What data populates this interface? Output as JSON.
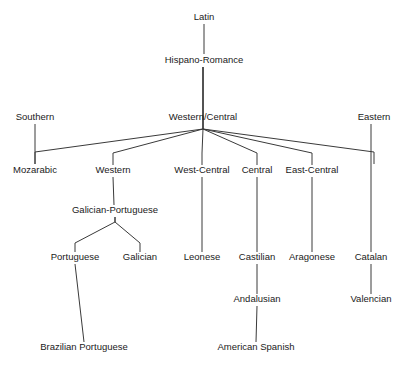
{
  "figure": {
    "kind": "language-family-tree",
    "background_color": "#ffffff",
    "line_color": "#3a3a3a",
    "text_color": "#1a1a1a"
  },
  "nodes": [
    {
      "id": "latin",
      "label": "Latin",
      "x": 204,
      "y": 20
    },
    {
      "id": "hispano-romance",
      "label": "Hispano-Romance",
      "x": 204,
      "y": 63
    },
    {
      "id": "southern",
      "label": "Southern",
      "x": 35,
      "y": 120
    },
    {
      "id": "western-central",
      "label": "Western/Central",
      "x": 203,
      "y": 120
    },
    {
      "id": "eastern",
      "label": "Eastern",
      "x": 374,
      "y": 120
    },
    {
      "id": "mozarabic",
      "label": "Mozarabic",
      "x": 35,
      "y": 173
    },
    {
      "id": "western",
      "label": "Western",
      "x": 113,
      "y": 173
    },
    {
      "id": "west-central",
      "label": "West-Central",
      "x": 202,
      "y": 173
    },
    {
      "id": "central",
      "label": "Central",
      "x": 257,
      "y": 173
    },
    {
      "id": "east-central",
      "label": "East-Central",
      "x": 312,
      "y": 173
    },
    {
      "id": "galician-portuguese",
      "label": "Galician-Portuguese",
      "x": 115,
      "y": 213
    },
    {
      "id": "portuguese",
      "label": "Portuguese",
      "x": 75,
      "y": 260
    },
    {
      "id": "galician",
      "label": "Galician",
      "x": 140,
      "y": 260
    },
    {
      "id": "leonese",
      "label": "Leonese",
      "x": 202,
      "y": 260
    },
    {
      "id": "castilian",
      "label": "Castilian",
      "x": 257,
      "y": 260
    },
    {
      "id": "aragonese",
      "label": "Aragonese",
      "x": 312,
      "y": 260
    },
    {
      "id": "catalan",
      "label": "Catalan",
      "x": 371,
      "y": 260
    },
    {
      "id": "andalusian",
      "label": "Andalusian",
      "x": 257,
      "y": 302
    },
    {
      "id": "valencian",
      "label": "Valencian",
      "x": 371,
      "y": 302
    },
    {
      "id": "brazilian-portuguese",
      "label": "Brazilian Portuguese",
      "x": 84,
      "y": 350
    },
    {
      "id": "american-spanish",
      "label": "American Spanish",
      "x": 256,
      "y": 350
    }
  ],
  "edges": [
    {
      "from": "latin",
      "to": "hispano-romance",
      "points": [
        [
          204,
          24
        ],
        [
          204,
          54
        ]
      ]
    },
    {
      "from": "hispano-romance",
      "to": "southern",
      "points": [
        [
          203,
          67
        ],
        [
          203,
          129
        ],
        [
          35,
          152
        ],
        [
          35,
          164
        ]
      ]
    },
    {
      "from": "hispano-romance",
      "to": "western-central",
      "points": [
        [
          203,
          67
        ],
        [
          203,
          129
        ]
      ]
    },
    {
      "from": "hispano-romance",
      "to": "eastern",
      "points": [
        [
          203,
          67
        ],
        [
          203,
          129
        ],
        [
          374,
          152
        ],
        [
          374,
          164
        ]
      ]
    },
    {
      "from": "southern",
      "to": "mozarabic",
      "points": [
        [
          35,
          124
        ],
        [
          35,
          164
        ]
      ]
    },
    {
      "from": "western-central",
      "to": "western",
      "points": [
        [
          203,
          129
        ],
        [
          113,
          153
        ],
        [
          113,
          165
        ]
      ]
    },
    {
      "from": "western-central",
      "to": "west-central",
      "points": [
        [
          203,
          129
        ],
        [
          202,
          153
        ],
        [
          202,
          165
        ]
      ]
    },
    {
      "from": "western-central",
      "to": "central",
      "points": [
        [
          203,
          129
        ],
        [
          257,
          153
        ],
        [
          257,
          165
        ]
      ]
    },
    {
      "from": "western-central",
      "to": "east-central",
      "points": [
        [
          203,
          129
        ],
        [
          312,
          153
        ],
        [
          312,
          165
        ]
      ]
    },
    {
      "from": "western",
      "to": "galician-portuguese",
      "points": [
        [
          113,
          177
        ],
        [
          114,
          205
        ]
      ]
    },
    {
      "from": "galician-portuguese",
      "to": "portuguese",
      "points": [
        [
          115,
          217
        ],
        [
          115,
          222
        ],
        [
          75,
          243
        ],
        [
          75,
          252
        ]
      ]
    },
    {
      "from": "galician-portuguese",
      "to": "galician",
      "points": [
        [
          115,
          217
        ],
        [
          115,
          222
        ],
        [
          140,
          243
        ],
        [
          140,
          252
        ]
      ]
    },
    {
      "from": "west-central",
      "to": "leonese",
      "points": [
        [
          202,
          177
        ],
        [
          202,
          252
        ]
      ]
    },
    {
      "from": "central",
      "to": "castilian",
      "points": [
        [
          257,
          177
        ],
        [
          257,
          252
        ]
      ]
    },
    {
      "from": "east-central",
      "to": "aragonese",
      "points": [
        [
          312,
          177
        ],
        [
          312,
          252
        ]
      ]
    },
    {
      "from": "eastern",
      "to": "catalan",
      "points": [
        [
          371,
          124
        ],
        [
          371,
          252
        ]
      ]
    },
    {
      "from": "castilian",
      "to": "andalusian",
      "points": [
        [
          257,
          264
        ],
        [
          257,
          294
        ]
      ]
    },
    {
      "from": "catalan",
      "to": "valencian",
      "points": [
        [
          371,
          264
        ],
        [
          371,
          294
        ]
      ]
    },
    {
      "from": "portuguese",
      "to": "brazilian-portuguese",
      "points": [
        [
          75,
          264
        ],
        [
          84,
          342
        ]
      ]
    },
    {
      "from": "andalusian",
      "to": "american-spanish",
      "points": [
        [
          257,
          306
        ],
        [
          256,
          342
        ]
      ]
    }
  ]
}
